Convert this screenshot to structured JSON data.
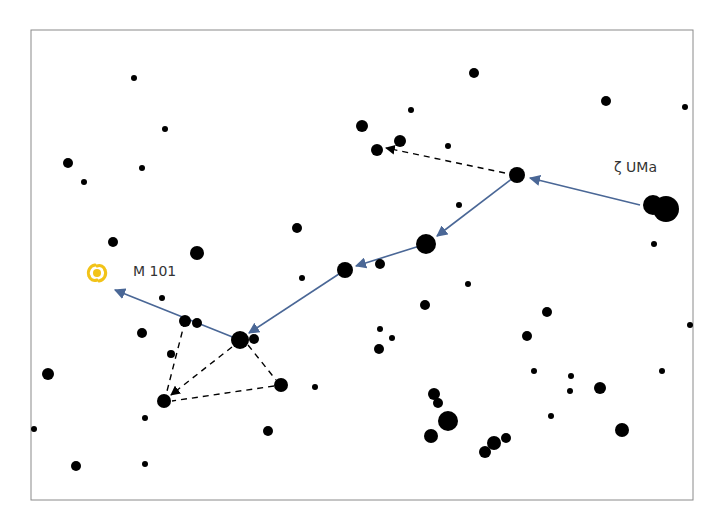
{
  "diagram": {
    "frame": {
      "x": 31,
      "y": 30,
      "width": 303,
      "height": 210,
      "border_color": "#8a8a8a"
    },
    "colors": {
      "star": "#000000",
      "path": "#4a6796",
      "dashed": "#000000",
      "galaxy": "#f2c318",
      "label": "#333333"
    },
    "labels": {
      "zeta_uma": "ζ UMa",
      "m101": "M 101"
    },
    "galaxy": {
      "name": "M 101",
      "x": 97,
      "y": 273
    },
    "stars": [
      [
        134,
        78,
        3
      ],
      [
        165,
        129,
        3
      ],
      [
        68,
        163,
        5
      ],
      [
        84,
        182,
        3
      ],
      [
        142,
        168,
        3
      ],
      [
        113,
        242,
        5
      ],
      [
        197,
        253,
        7
      ],
      [
        297,
        228,
        5
      ],
      [
        474,
        73,
        5
      ],
      [
        606,
        101,
        5
      ],
      [
        685,
        107,
        3
      ],
      [
        362,
        126,
        6
      ],
      [
        400,
        141,
        6
      ],
      [
        377,
        150,
        6
      ],
      [
        411,
        110,
        3
      ],
      [
        448,
        146,
        3
      ],
      [
        459,
        205,
        3
      ],
      [
        517,
        175,
        8
      ],
      [
        653,
        205,
        10
      ],
      [
        666,
        209,
        13
      ],
      [
        654,
        244,
        3
      ],
      [
        426,
        244,
        10
      ],
      [
        345,
        270,
        8
      ],
      [
        380,
        264,
        5
      ],
      [
        302,
        278,
        3
      ],
      [
        162,
        298,
        3
      ],
      [
        185,
        321,
        6
      ],
      [
        197,
        323,
        5
      ],
      [
        142,
        333,
        5
      ],
      [
        240,
        340,
        9
      ],
      [
        254,
        339,
        5
      ],
      [
        171,
        354,
        4
      ],
      [
        48,
        374,
        6
      ],
      [
        281,
        385,
        7
      ],
      [
        315,
        387,
        3
      ],
      [
        164,
        401,
        7
      ],
      [
        145,
        418,
        3
      ],
      [
        268,
        431,
        5
      ],
      [
        34,
        429,
        3
      ],
      [
        76,
        466,
        5
      ],
      [
        145,
        464,
        3
      ],
      [
        468,
        284,
        3
      ],
      [
        425,
        305,
        5
      ],
      [
        547,
        312,
        5
      ],
      [
        380,
        329,
        3
      ],
      [
        392,
        338,
        3
      ],
      [
        379,
        349,
        5
      ],
      [
        527,
        336,
        5
      ],
      [
        534,
        371,
        3
      ],
      [
        571,
        376,
        3
      ],
      [
        570,
        391,
        3
      ],
      [
        600,
        388,
        6
      ],
      [
        662,
        371,
        3
      ],
      [
        690,
        325,
        3
      ],
      [
        434,
        394,
        6
      ],
      [
        438,
        403,
        5
      ],
      [
        448,
        421,
        10
      ],
      [
        431,
        436,
        7
      ],
      [
        551,
        416,
        3
      ],
      [
        506,
        438,
        5
      ],
      [
        494,
        443,
        7
      ],
      [
        485,
        452,
        6
      ],
      [
        622,
        430,
        7
      ]
    ],
    "solid_path": [
      {
        "from": [
          640,
          205
        ],
        "to": [
          530,
          178
        ]
      },
      {
        "from": [
          517,
          175
        ],
        "to": [
          437,
          236
        ]
      },
      {
        "from": [
          426,
          244
        ],
        "to": [
          356,
          266
        ]
      },
      {
        "from": [
          345,
          270
        ],
        "to": [
          249,
          333
        ]
      },
      {
        "from": [
          240,
          340
        ],
        "to": [
          115,
          290
        ]
      }
    ],
    "dashed_path": [
      {
        "from": [
          505,
          173
        ],
        "to": [
          386,
          148
        ],
        "arrow": true
      },
      {
        "from": [
          185,
          321
        ],
        "to": [
          166,
          395
        ],
        "arrow": false
      },
      {
        "from": [
          232,
          347
        ],
        "to": [
          171,
          395
        ],
        "arrow": true
      },
      {
        "from": [
          248,
          345
        ],
        "to": [
          276,
          380
        ],
        "arrow": false
      },
      {
        "from": [
          274,
          386
        ],
        "to": [
          172,
          401
        ],
        "arrow": false
      }
    ]
  }
}
